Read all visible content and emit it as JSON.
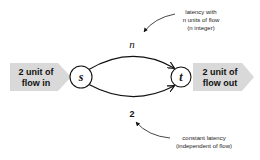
{
  "diagram": {
    "source_input": {
      "line1": "2 unit of",
      "line2": "flow in"
    },
    "sink_output": {
      "line1": "2 unit of",
      "line2": "flow out"
    },
    "nodes": {
      "source": "s",
      "target": "t"
    },
    "edges": {
      "top": {
        "label": "n"
      },
      "bottom": {
        "label": "2"
      }
    },
    "annotations": {
      "top": {
        "line1": "latency with",
        "line2": "n units of flow",
        "line3": "(n integer)"
      },
      "bottom": {
        "line1": "constant latency",
        "line2": "(independent of flow)"
      }
    },
    "colors": {
      "arrow_fill": "#d9d9d9",
      "stroke": "#111111"
    }
  }
}
